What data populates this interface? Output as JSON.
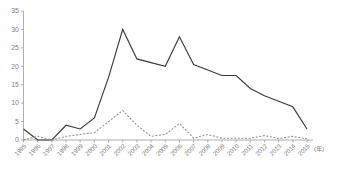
{
  "chart_data": {
    "type": "line",
    "title": "",
    "subtitle": "",
    "xlabel": "(年)",
    "ylabel": "",
    "grid": false,
    "legend_position": "none",
    "xlim": [
      1995,
      2015
    ],
    "ylim": [
      0,
      35
    ],
    "y_ticks": [
      0,
      5,
      10,
      15,
      20,
      25,
      30,
      35
    ],
    "y_tick_labels": [
      "0",
      "5",
      "10",
      "15",
      "20",
      "25",
      "30",
      "35"
    ],
    "categories": [
      "1995",
      "1996",
      "1997",
      "1998",
      "1999",
      "2000",
      "2001",
      "2002",
      "2003",
      "2004",
      "2005",
      "2006",
      "2007",
      "2008",
      "2009",
      "2010",
      "2011",
      "2012",
      "2013",
      "2014",
      "2015"
    ],
    "x_tick_rotation": 45,
    "series": [
      {
        "name": "solid-series",
        "style": "solid",
        "color": "#3a3a3a",
        "values": [
          3,
          0,
          0,
          4,
          3,
          6,
          17,
          30,
          22,
          21,
          20,
          28,
          20.5,
          19,
          17.5,
          17.5,
          14,
          12,
          10.5,
          9,
          3
        ]
      },
      {
        "name": "dashed-series",
        "style": "dashed",
        "color": "#8e8e8e",
        "values": [
          0,
          1,
          0,
          1,
          1.5,
          2,
          5,
          8,
          4,
          1,
          1.5,
          4.5,
          0.5,
          1.5,
          0.5,
          0.5,
          0.5,
          1.2,
          0.4,
          1,
          0.3
        ]
      }
    ],
    "axis_color": "#9a9a9a",
    "tick_label_color": "#7d7d7d"
  },
  "axes": {
    "x_unit_suffix": "(年)"
  }
}
